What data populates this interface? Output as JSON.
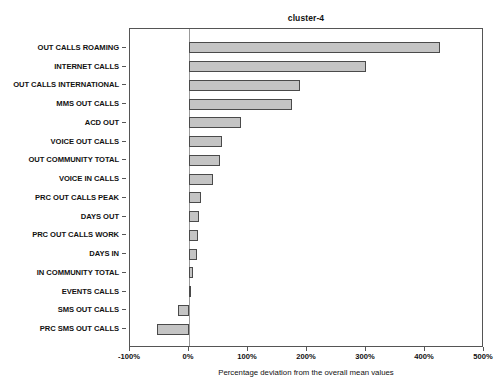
{
  "chart_data": {
    "type": "bar",
    "orientation": "horizontal",
    "title": "cluster-4",
    "xlabel": "Percentage deviation from the overall mean values",
    "ylabel": "",
    "xlim": [
      -100,
      500
    ],
    "xticks": [
      -100,
      0,
      100,
      200,
      300,
      400,
      500
    ],
    "xtick_labels": [
      "-100%",
      "0%",
      "100%",
      "200%",
      "300%",
      "400%",
      "500%"
    ],
    "grid": false,
    "legend": null,
    "zero_reference_line": 0,
    "bar_fill_color": "#c4c4c4",
    "bar_edge_color": "#4a4a4a",
    "categories": [
      "OUT CALLS ROAMING",
      "INTERNET CALLS",
      "OUT CALLS INTERNATIONAL",
      "MMS OUT CALLS",
      "ACD OUT",
      "VOICE OUT CALLS",
      "OUT COMMUNITY TOTAL",
      "VOICE IN CALLS",
      "PRC OUT CALLS PEAK",
      "DAYS OUT",
      "PRC OUT CALLS WORK",
      "DAYS IN",
      "IN COMMUNITY TOTAL",
      "EVENTS CALLS",
      "SMS OUT CALLS",
      "PRC SMS OUT CALLS"
    ],
    "values": [
      425,
      300,
      188,
      175,
      88,
      56,
      53,
      40,
      20,
      17,
      16,
      13,
      7,
      2,
      -19,
      -54
    ]
  }
}
